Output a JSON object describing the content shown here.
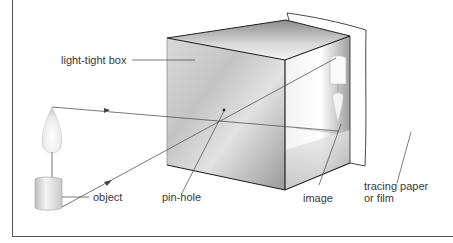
{
  "diagram": {
    "type": "pinhole-camera",
    "labels": {
      "box": "light-tight box",
      "object": "object",
      "pinhole": "pin-hole",
      "image": "image",
      "screen_line1": "tracing paper",
      "screen_line2": "or film"
    },
    "colors": {
      "line": "#444444",
      "box_edge": "#1e1e1e",
      "text": "#3a3a3a",
      "background": "#ffffff"
    }
  }
}
